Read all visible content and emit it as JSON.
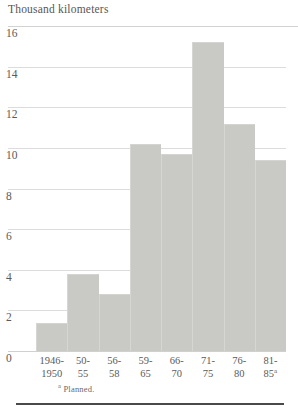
{
  "chart_data": {
    "type": "bar",
    "title": "Thousand kilometers",
    "xlabel": "",
    "ylabel": "Thousand kilometers",
    "categories": [
      "1946-1950",
      "50-55",
      "56-58",
      "59-65",
      "66-70",
      "71-75",
      "76-80",
      "81-85"
    ],
    "category_lines": [
      {
        "line1": "1946-",
        "line2": "1950",
        "superscript": ""
      },
      {
        "line1": "50-",
        "line2": "55",
        "superscript": ""
      },
      {
        "line1": "56-",
        "line2": "58",
        "superscript": ""
      },
      {
        "line1": "59-",
        "line2": "65",
        "superscript": ""
      },
      {
        "line1": "66-",
        "line2": "70",
        "superscript": ""
      },
      {
        "line1": "71-",
        "line2": "75",
        "superscript": ""
      },
      {
        "line1": "76-",
        "line2": "80",
        "superscript": ""
      },
      {
        "line1": "81-",
        "line2": "85",
        "superscript": "a"
      }
    ],
    "values": [
      1.4,
      3.8,
      2.8,
      10.2,
      9.7,
      15.2,
      11.2,
      9.4
    ],
    "ylim": [
      0,
      16
    ],
    "yticks": [
      16,
      14,
      12,
      10,
      8,
      6,
      4,
      2,
      0
    ],
    "grid": true,
    "legend": "none",
    "bar_color": "#c9c9c6",
    "gridline_color": "#dcdcdc",
    "text_color": "#5a5a5a",
    "footnote": "Planned.",
    "footnote_marker": "a"
  }
}
